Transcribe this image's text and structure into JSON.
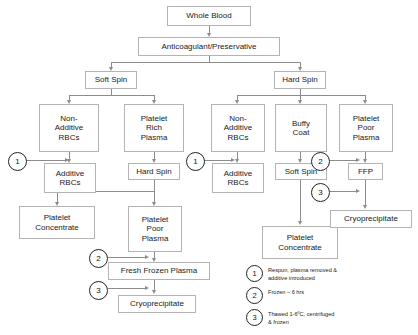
{
  "diagram": {
    "nodes": {
      "whole_blood": "Whole Blood",
      "anticoagulant": "Anticoagulant/Preservative",
      "soft_spin_left": "Soft Spin",
      "hard_spin_right": "Hard Spin",
      "non_additive_rbcs_l": "Non-\nAdditive\nRBCs",
      "platelet_rich_plasma": "Platelet\nRich\nPlasma",
      "non_additive_rbcs_r": "Non-\nAdditive\nRBCs",
      "buffy_coat": "Buffy\nCoat",
      "platelet_poor_plasma_r": "Platelet\nPoor\nPlasma",
      "additive_rbcs_l": "Additive\nRBCs",
      "hard_spin_mid": "Hard Spin",
      "additive_rbcs_r": "Additive\nRBCs",
      "soft_spin_right": "Soft Spin",
      "ffp_short": "FFP",
      "platelet_concentrate_l": "Platelet\nConcentrate",
      "platelet_poor_plasma_l": "Platelet\nPoor\nPlasma",
      "cryoprecipitate_r": "Cryoprecipitate",
      "platelet_concentrate_r": "Platelet\nConcentrate",
      "fresh_frozen_plasma": "Fresh Frozen Plasma",
      "cryoprecipitate_l": "Cryoprecipitate"
    },
    "markers": {
      "one": "1",
      "two": "2",
      "three": "3"
    },
    "legend": [
      {
        "num": "1",
        "text": "Respun, plasma removed &\nadditive  introduced"
      },
      {
        "num": "2",
        "text": "Frozen – 6 hrs"
      },
      {
        "num": "3",
        "text": "Thawed 1-6ºC, centrifuged\n        & frozen"
      }
    ],
    "colors": {
      "border": "#b3b3b3",
      "connector": "#8c8c8c",
      "text": "#1a1a1a",
      "background": "#ffffff"
    }
  }
}
